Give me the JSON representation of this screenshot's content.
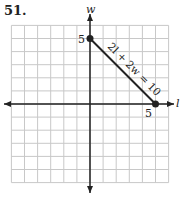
{
  "problem": {
    "number": "51."
  },
  "chart_data": {
    "type": "line",
    "title": "",
    "xlabel": "l",
    "ylabel": "w",
    "xlim": [
      -6,
      6
    ],
    "ylim": [
      -6,
      6
    ],
    "grid": true,
    "tick_labels": {
      "x": [
        "5"
      ],
      "y": [
        "5"
      ]
    },
    "series": [
      {
        "name": "2l + 2w = 10",
        "points": [
          {
            "x": 0,
            "y": 5
          },
          {
            "x": 5,
            "y": 0
          }
        ],
        "endpoint_markers": true
      }
    ],
    "annotations": [
      {
        "text": "2l + 2w = 10",
        "angle": 45
      }
    ]
  },
  "labels": {
    "x_axis": "l",
    "y_axis": "w",
    "x_tick": "5",
    "y_tick": "5",
    "equation": "2l + 2w = 10"
  },
  "colors": {
    "grid": "#c8c8c8",
    "axis": "#222222",
    "line": "#222222"
  }
}
